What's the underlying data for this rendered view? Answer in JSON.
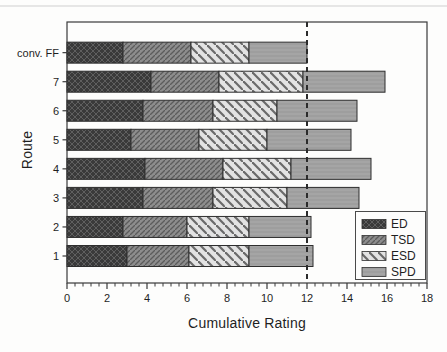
{
  "figure": {
    "background": "#fdfdfc",
    "frame_color": "#3a3a3a",
    "text_color": "#1f1f1f",
    "bar_outline_color": "#2e2e2e",
    "scan_artifact_line_color": "#cfcfcf"
  },
  "chart_data": {
    "type": "bar",
    "orientation": "horizontal",
    "stacked": true,
    "title": "",
    "xlabel": "Cumulative Rating",
    "ylabel": "Route",
    "xlim": [
      0,
      18
    ],
    "x_major_ticks": [
      "0",
      "2",
      "4",
      "6",
      "8",
      "10",
      "12",
      "14",
      "16",
      "18"
    ],
    "x_minor_tick_step": 0.4,
    "grid": false,
    "categories": [
      "1",
      "2",
      "3",
      "4",
      "5",
      "6",
      "7",
      "conv. FF"
    ],
    "series": [
      {
        "name": "ED",
        "pattern": "crosshatch",
        "fill": "#3a3a3a",
        "hatch": "#5f5f5f",
        "values": [
          3.0,
          2.8,
          3.8,
          3.9,
          3.2,
          3.8,
          4.2,
          2.8
        ]
      },
      {
        "name": "TSD",
        "pattern": "diag-forward",
        "fill": "#8d8d8d",
        "hatch": "#5c5c5c",
        "values": [
          3.1,
          3.2,
          3.5,
          3.9,
          3.4,
          3.5,
          3.4,
          3.4
        ]
      },
      {
        "name": "ESD",
        "pattern": "diag-back",
        "fill": "#e3e3e3",
        "hatch": "#6a6a6a",
        "values": [
          3.0,
          3.1,
          3.7,
          3.4,
          3.4,
          3.2,
          4.2,
          2.9
        ]
      },
      {
        "name": "SPD",
        "pattern": "solid-hlines",
        "fill": "#9e9e9e",
        "hatch": "#adadad",
        "values": [
          3.2,
          3.1,
          3.6,
          4.0,
          4.2,
          4.0,
          4.1,
          2.9
        ]
      }
    ],
    "reference_line": {
      "x": 12,
      "style": "dashed",
      "color": "#2b2b2b"
    },
    "legend": {
      "position": "lower-right",
      "entries": [
        "ED",
        "TSD",
        "ESD",
        "SPD"
      ]
    }
  }
}
